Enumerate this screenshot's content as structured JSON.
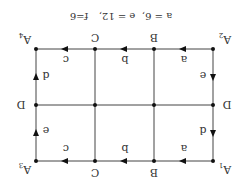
{
  "diagram": {
    "orientation": "rotated-180",
    "caption": {
      "a": "a = 6,",
      "e": "e = 12,",
      "f": "f=6"
    },
    "corner_labels": {
      "top_left": "A",
      "top_left_sub": "1",
      "top_right": "A",
      "top_right_sub": "3",
      "bottom_left": "A",
      "bottom_left_sub": "2",
      "bottom_right": "A",
      "bottom_right_sub": "4"
    },
    "column_labels_top": [
      "B",
      "C"
    ],
    "column_labels_bottom": [
      "B",
      "C"
    ],
    "row_labels": {
      "left": "D",
      "right": "D"
    },
    "edge_labels": {
      "top": [
        "a",
        "b",
        "c"
      ],
      "bottom": [
        "a",
        "b",
        "c"
      ],
      "left_upper": "d",
      "left_lower": "e",
      "right_upper": "e",
      "right_lower": "d"
    },
    "colors": {
      "line": "#444444",
      "node": "#111111",
      "text": "#333333"
    }
  }
}
